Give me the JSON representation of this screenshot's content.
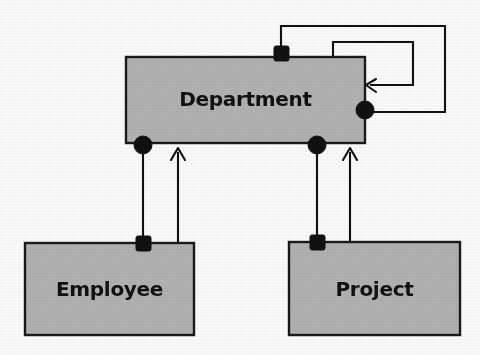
{
  "diagram": {
    "type": "entity-relationship-diagram",
    "background_color": "#fdfdfd",
    "entity_fill_color": "#b3b3b3",
    "entity_stroke_color": "#1a1a1a",
    "connector_color": "#111111",
    "entities": [
      {
        "id": "department",
        "label": "Department",
        "x": 126,
        "y": 57,
        "width": 239,
        "height": 86
      },
      {
        "id": "employee",
        "label": "Employee",
        "x": 25,
        "y": 243,
        "width": 169,
        "height": 92
      },
      {
        "id": "project",
        "label": "Project",
        "x": 289,
        "y": 242,
        "width": 171,
        "height": 93
      }
    ],
    "connectors": [
      {
        "id": "department-self-outer",
        "from": "department-top-square",
        "to": "department-right-circle",
        "source_marker": "filled-square",
        "target_marker": "filled-circle"
      },
      {
        "id": "department-self-inner",
        "from": "department-top",
        "to": "department-right-edge",
        "source_marker": "none",
        "target_marker": "arrowhead"
      },
      {
        "id": "department-employee-aggregation",
        "from": "department-bottom-left-circle",
        "to": "employee-top-square",
        "source_marker": "filled-circle",
        "target_marker": "filled-square"
      },
      {
        "id": "employee-department-arrow",
        "from": "employee-top",
        "to": "department-bottom",
        "source_marker": "none",
        "target_marker": "arrowhead"
      },
      {
        "id": "department-project-aggregation",
        "from": "department-bottom-right-circle",
        "to": "project-top-square",
        "source_marker": "filled-circle",
        "target_marker": "filled-square"
      },
      {
        "id": "project-department-arrow",
        "from": "project-top",
        "to": "department-bottom",
        "source_marker": "none",
        "target_marker": "arrowhead"
      }
    ],
    "markers": [
      {
        "id": "department-top-square",
        "shape": "filled-square",
        "x": 281,
        "y": 53
      },
      {
        "id": "department-right-circle",
        "shape": "filled-circle",
        "x": 365,
        "y": 110
      },
      {
        "id": "department-bottom-left-circle",
        "shape": "filled-circle",
        "x": 143,
        "y": 144
      },
      {
        "id": "department-bottom-right-circle",
        "shape": "filled-circle",
        "x": 317,
        "y": 144
      },
      {
        "id": "employee-top-square",
        "shape": "filled-square",
        "x": 143,
        "y": 243
      },
      {
        "id": "project-top-square",
        "shape": "filled-square",
        "x": 317,
        "y": 242
      }
    ]
  }
}
